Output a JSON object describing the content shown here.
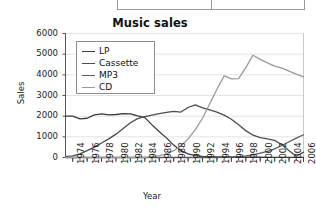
{
  "top_widget": {
    "cells": [
      "",
      ""
    ]
  },
  "chart_data": {
    "type": "line",
    "title": "Music sales",
    "xlabel": "Year",
    "ylabel": "Sales",
    "grid": true,
    "legend_position": "top-left-inside",
    "xlim": [
      1973,
      2006
    ],
    "ylim": [
      0,
      6000
    ],
    "yticks": [
      0,
      1000,
      2000,
      3000,
      4000,
      5000,
      6000
    ],
    "ytick_labels": [
      "0",
      "1000",
      "2000",
      "3000",
      "4000",
      "5000",
      "6000"
    ],
    "xticks": [
      1974,
      1976,
      1978,
      1980,
      1982,
      1984,
      1986,
      1988,
      1990,
      1992,
      1994,
      1996,
      1998,
      2000,
      2002,
      2004,
      2006
    ],
    "xtick_labels": [
      "1974",
      "1976",
      "1978",
      "1980",
      "1982",
      "1984",
      "1986",
      "1988",
      "1990",
      "1992",
      "1994",
      "1996",
      "1998",
      "2000",
      "2002",
      "2004",
      "2006"
    ],
    "x": [
      1973,
      1974,
      1975,
      1976,
      1977,
      1978,
      1979,
      1980,
      1981,
      1982,
      1983,
      1984,
      1985,
      1986,
      1987,
      1988,
      1989,
      1990,
      1991,
      1992,
      1993,
      1994,
      1995,
      1996,
      1997,
      1998,
      1999,
      2000,
      2001,
      2002,
      2003,
      2004,
      2005,
      2006
    ],
    "series": [
      {
        "name": "LP",
        "color": "#3a3a3a",
        "values": [
          2000,
          2000,
          1870,
          1900,
          2060,
          2110,
          2060,
          2080,
          2120,
          2110,
          2010,
          1930,
          1580,
          1250,
          950,
          600,
          330,
          180,
          90,
          55,
          40,
          30,
          25,
          20,
          18,
          15,
          14,
          12,
          10,
          10,
          8,
          8,
          8,
          8
        ]
      },
      {
        "name": "Cassette",
        "color": "#4d4d4d",
        "values": [
          40,
          80,
          180,
          330,
          500,
          700,
          900,
          1130,
          1400,
          1680,
          1880,
          1980,
          2050,
          2120,
          2180,
          2230,
          2200,
          2420,
          2550,
          2400,
          2300,
          2200,
          2050,
          1850,
          1580,
          1300,
          1080,
          960,
          900,
          830,
          620,
          330,
          60,
          260
        ]
      },
      {
        "name": "MP3",
        "color": "#5c5c5c",
        "values": [
          0,
          0,
          0,
          0,
          0,
          0,
          0,
          0,
          0,
          0,
          0,
          0,
          0,
          0,
          0,
          0,
          0,
          0,
          0,
          0,
          0,
          0,
          10,
          25,
          45,
          75,
          130,
          210,
          300,
          420,
          580,
          760,
          940,
          1100
        ]
      },
      {
        "name": "CD",
        "color": "#9a9a9a",
        "values": [
          0,
          0,
          0,
          0,
          0,
          0,
          0,
          0,
          0,
          0,
          0,
          10,
          40,
          90,
          180,
          330,
          560,
          900,
          1350,
          1900,
          2600,
          3300,
          3950,
          3800,
          3820,
          4350,
          4950,
          4750,
          4580,
          4420,
          4320,
          4180,
          4030,
          3900
        ]
      }
    ]
  }
}
